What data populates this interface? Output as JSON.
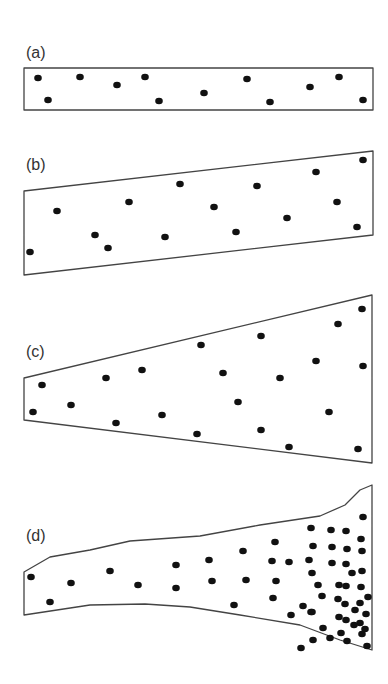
{
  "figure": {
    "colors": {
      "outline": "#444444",
      "dot": "#111111",
      "background": "#ffffff"
    },
    "panels": [
      {
        "label": "(a)",
        "label_pos": [
          26,
          58
        ],
        "shape": "rectangle",
        "outline": [
          [
            24,
            68
          ],
          [
            373,
            68
          ],
          [
            373,
            110
          ],
          [
            24,
            110
          ]
        ],
        "dots": [
          [
            38,
            78
          ],
          [
            80,
            77
          ],
          [
            117,
            85
          ],
          [
            145,
            77
          ],
          [
            247,
            79
          ],
          [
            310,
            87
          ],
          [
            339,
            77
          ],
          [
            48,
            100
          ],
          [
            159,
            101
          ],
          [
            204,
            93
          ],
          [
            270,
            102
          ],
          [
            363,
            100
          ]
        ]
      },
      {
        "label": "(b)",
        "label_pos": [
          26,
          170
        ],
        "shape": "tilted quadrilateral",
        "outline": [
          [
            24,
            191
          ],
          [
            373,
            151
          ],
          [
            373,
            235
          ],
          [
            24,
            275
          ]
        ],
        "dots": [
          [
            57,
            211
          ],
          [
            129,
            202
          ],
          [
            180,
            184
          ],
          [
            257,
            186
          ],
          [
            214,
            207
          ],
          [
            316,
            172
          ],
          [
            363,
            160
          ],
          [
            337,
            202
          ],
          [
            287,
            218
          ],
          [
            357,
            227
          ],
          [
            236,
            232
          ],
          [
            165,
            237
          ],
          [
            95,
            235
          ],
          [
            108,
            248
          ],
          [
            30,
            252
          ]
        ]
      },
      {
        "label": "(c)",
        "label_pos": [
          26,
          357
        ],
        "shape": "expanding trapezoid",
        "outline": [
          [
            24,
            378
          ],
          [
            372,
            295
          ],
          [
            372,
            463
          ],
          [
            24,
            420
          ]
        ],
        "dots": [
          [
            42,
            385
          ],
          [
            33,
            412
          ],
          [
            71,
            405
          ],
          [
            106,
            378
          ],
          [
            142,
            370
          ],
          [
            201,
            345
          ],
          [
            223,
            373
          ],
          [
            261,
            336
          ],
          [
            280,
            378
          ],
          [
            316,
            361
          ],
          [
            363,
            366
          ],
          [
            338,
            324
          ],
          [
            362,
            309
          ],
          [
            116,
            423
          ],
          [
            162,
            415
          ],
          [
            238,
            402
          ],
          [
            197,
            434
          ],
          [
            261,
            430
          ],
          [
            329,
            412
          ],
          [
            289,
            447
          ],
          [
            358,
            449
          ]
        ]
      },
      {
        "label": "(d)",
        "label_pos": [
          26,
          541
        ],
        "shape": "flared irregular channel",
        "outline": [
          [
            24,
            572
          ],
          [
            50,
            557
          ],
          [
            90,
            550
          ],
          [
            130,
            541
          ],
          [
            200,
            536
          ],
          [
            260,
            525
          ],
          [
            320,
            516
          ],
          [
            345,
            505
          ],
          [
            360,
            490
          ],
          [
            372,
            485
          ],
          [
            372,
            650
          ],
          [
            340,
            640
          ],
          [
            300,
            625
          ],
          [
            240,
            615
          ],
          [
            190,
            607
          ],
          [
            145,
            604
          ],
          [
            90,
            605
          ],
          [
            24,
            615
          ]
        ],
        "dots": [
          [
            31,
            577
          ],
          [
            50,
            602
          ],
          [
            71,
            583
          ],
          [
            110,
            571
          ],
          [
            138,
            585
          ],
          [
            176,
            565
          ],
          [
            176,
            588
          ],
          [
            209,
            560
          ],
          [
            212,
            581
          ],
          [
            234,
            605
          ],
          [
            243,
            551
          ],
          [
            246,
            580
          ],
          [
            275,
            542
          ],
          [
            272,
            561
          ],
          [
            289,
            562
          ],
          [
            276,
            581
          ],
          [
            273,
            598
          ],
          [
            311,
            528
          ],
          [
            313,
            546
          ],
          [
            309,
            560
          ],
          [
            312,
            573
          ],
          [
            303,
            606
          ],
          [
            311,
            612
          ],
          [
            318,
            585
          ],
          [
            322,
            596
          ],
          [
            291,
            615
          ],
          [
            312,
            612
          ],
          [
            331,
            530
          ],
          [
            332,
            547
          ],
          [
            332,
            563
          ],
          [
            346,
            531
          ],
          [
            347,
            549
          ],
          [
            346,
            564
          ],
          [
            346,
            586
          ],
          [
            345,
            604
          ],
          [
            346,
            620
          ],
          [
            363,
            517
          ],
          [
            361,
            539
          ],
          [
            362,
            551
          ],
          [
            362,
            571
          ],
          [
            361,
            587
          ],
          [
            360,
            603
          ],
          [
            360,
            623
          ],
          [
            362,
            634
          ],
          [
            323,
            628
          ],
          [
            339,
            585
          ],
          [
            338,
            599
          ],
          [
            339,
            617
          ],
          [
            341,
            633
          ],
          [
            352,
            573
          ],
          [
            355,
            610
          ],
          [
            354,
            625
          ],
          [
            368,
            597
          ],
          [
            366,
            614
          ],
          [
            365,
            629
          ],
          [
            367,
            646
          ],
          [
            347,
            641
          ],
          [
            330,
            638
          ],
          [
            313,
            640
          ],
          [
            301,
            648
          ]
        ]
      }
    ]
  }
}
